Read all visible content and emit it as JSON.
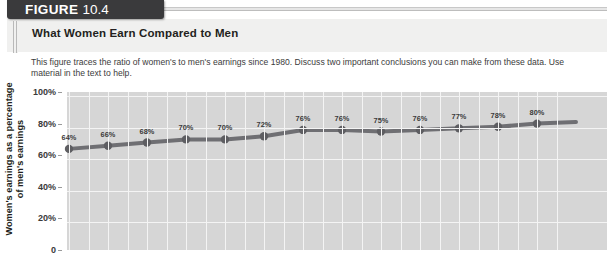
{
  "banner": {
    "figure_word": "FIGURE",
    "figure_number": "10.4"
  },
  "title": "What Women Earn Compared to Men",
  "description": "This figure traces the ratio of women's to men's earnings since 1980. Discuss two important conclusions you can make from these data. Use material in the text to help.",
  "colors": {
    "banner_bg": "#3a3a3c",
    "title_band_bg": "#f0f0ef",
    "plot_bg": "#d6d6d6",
    "grid": "#f4f4f4",
    "series_line": "#6f6f73",
    "series_marker": "#5e5e62"
  },
  "chart_data": {
    "type": "line",
    "title": "What Women Earn Compared to Men",
    "xlabel": "",
    "ylabel": "Women's earnings as a percentage\nof men's earnings",
    "ylim": [
      0,
      100
    ],
    "yticks": [
      "0",
      "20%",
      "40%",
      "60%",
      "80%",
      "100%"
    ],
    "ytick_values": [
      0,
      20,
      40,
      60,
      80,
      100
    ],
    "grid": true,
    "legend": "none",
    "values": [
      64,
      66,
      68,
      70,
      70,
      72,
      76,
      76,
      75,
      76,
      77,
      78,
      80
    ],
    "labels": [
      "64%",
      "66%",
      "68%",
      "70%",
      "70%",
      "72%",
      "76%",
      "76%",
      "75%",
      "76%",
      "77%",
      "78%",
      "80%"
    ]
  }
}
